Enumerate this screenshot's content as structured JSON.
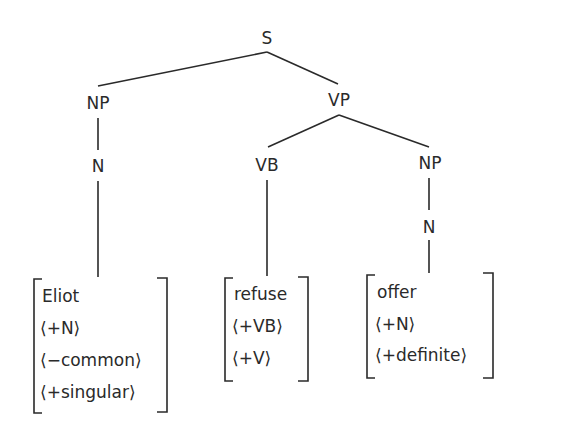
{
  "diagram": {
    "type": "syntax-tree",
    "nodes": {
      "root": "S",
      "subject_np": "NP",
      "subject_n": "N",
      "vp": "VP",
      "vb": "VB",
      "object_np": "NP",
      "object_n": "N"
    },
    "lexical_entries": [
      {
        "word": "Eliot",
        "features": [
          "⟨+N⟩",
          "⟨−common⟩",
          "⟨+singular⟩"
        ]
      },
      {
        "word": "refuse",
        "features": [
          "⟨+VB⟩",
          "⟨+V⟩"
        ]
      },
      {
        "word": "offer",
        "features": [
          "⟨+N⟩",
          "⟨+definite⟩"
        ]
      }
    ],
    "edges": [
      [
        "S",
        "NP"
      ],
      [
        "S",
        "VP"
      ],
      [
        "NP",
        "N"
      ],
      [
        "N",
        "Eliot"
      ],
      [
        "VP",
        "VB"
      ],
      [
        "VP",
        "NP"
      ],
      [
        "VB",
        "refuse"
      ],
      [
        "NP",
        "N"
      ],
      [
        "N",
        "offer"
      ]
    ],
    "line_color": "#2a2a2a"
  }
}
